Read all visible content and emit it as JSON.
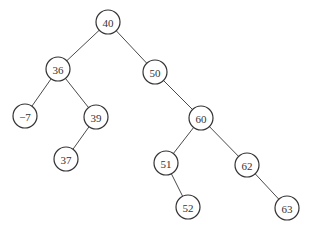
{
  "diagram": {
    "type": "binary-search-tree",
    "node_radius": 12,
    "nodes": [
      {
        "id": "n40",
        "label": "40",
        "x": 108,
        "y": 22
      },
      {
        "id": "n36",
        "label": "36",
        "x": 58,
        "y": 69
      },
      {
        "id": "n50",
        "label": "50",
        "x": 155,
        "y": 72
      },
      {
        "id": "nm7",
        "label": "−7",
        "x": 25,
        "y": 116
      },
      {
        "id": "n39",
        "label": "39",
        "x": 96,
        "y": 117
      },
      {
        "id": "n37",
        "label": "37",
        "x": 66,
        "y": 159
      },
      {
        "id": "n60",
        "label": "60",
        "x": 201,
        "y": 118
      },
      {
        "id": "n51",
        "label": "51",
        "x": 166,
        "y": 163
      },
      {
        "id": "n62",
        "label": "62",
        "x": 247,
        "y": 165
      },
      {
        "id": "n52",
        "label": "52",
        "x": 188,
        "y": 207
      },
      {
        "id": "n63",
        "label": "63",
        "x": 287,
        "y": 208
      }
    ],
    "edges": [
      {
        "from": "n40",
        "to": "n36"
      },
      {
        "from": "n40",
        "to": "n50"
      },
      {
        "from": "n36",
        "to": "nm7"
      },
      {
        "from": "n36",
        "to": "n39"
      },
      {
        "from": "n39",
        "to": "n37"
      },
      {
        "from": "n50",
        "to": "n60"
      },
      {
        "from": "n60",
        "to": "n51"
      },
      {
        "from": "n60",
        "to": "n62"
      },
      {
        "from": "n51",
        "to": "n52"
      },
      {
        "from": "n62",
        "to": "n63"
      }
    ],
    "colors": {
      "stroke": "#333333",
      "edge": "#4a4a4a",
      "fill": "#ffffff",
      "text": "#333333"
    }
  }
}
